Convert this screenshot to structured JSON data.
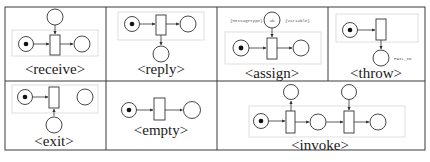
{
  "figure": {
    "type": "petri-net-mapping-table",
    "rows": 2,
    "colors": {
      "border": "#3a3a3a",
      "stroke": "#333333",
      "scope_box": "#d6d6d6",
      "token": "#111111",
      "background": "#ffffff"
    }
  },
  "cells": [
    {
      "id": "receive",
      "label": "<receive>",
      "elements": {
        "places": [
          "input-marked",
          "top-message",
          "output"
        ],
        "transitions": 1,
        "token_place": "input-marked"
      }
    },
    {
      "id": "reply",
      "label": "<reply>",
      "elements": {
        "places": [
          "input-marked",
          "output",
          "bottom-message"
        ],
        "transitions": 1,
        "token_place": "input-marked"
      }
    },
    {
      "id": "assign",
      "label": "<assign>",
      "annotations": {
        "left": "{MessageType}",
        "place_text": "ab",
        "right": "{Variable}"
      },
      "elements": {
        "places": [
          "input-marked",
          "top-variable",
          "output"
        ],
        "transitions": 1,
        "token_place": "input-marked"
      }
    },
    {
      "id": "throw",
      "label": "<throw>",
      "annotations": {
        "fault_place_text": "FAIL_ID"
      },
      "elements": {
        "places": [
          "input-marked",
          "fault"
        ],
        "transitions": 1,
        "token_place": "input-marked"
      }
    },
    {
      "id": "exit",
      "label": "<exit>",
      "elements": {
        "places": [
          "input-marked",
          "output-disconnected",
          "bottom"
        ],
        "transitions": 1,
        "token_place": "input-marked"
      }
    },
    {
      "id": "empty",
      "label": "<empty>",
      "elements": {
        "places": [
          "input-marked",
          "output"
        ],
        "transitions": 1,
        "token_place": "input-marked"
      }
    },
    {
      "id": "invoke",
      "label": "<invoke>",
      "elements": {
        "places": [
          "input-marked",
          "request-out",
          "middle",
          "response-in",
          "output"
        ],
        "transitions": 2,
        "token_place": "input-marked"
      }
    }
  ]
}
